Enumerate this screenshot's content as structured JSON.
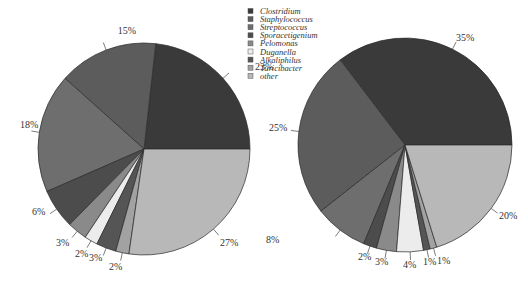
{
  "chart_data": [
    {
      "type": "pie",
      "title": "",
      "categories": [
        "Clostridium",
        "Staphylococcus",
        "Streptococcus",
        "Sporacetigenium",
        "Pelomonas",
        "Duganella",
        "Alkaliphilus",
        "Turicibacter",
        "other"
      ],
      "values": [
        23,
        15,
        18,
        6,
        3,
        2,
        3,
        2,
        27
      ],
      "labels": [
        "23%",
        "15%",
        "18%",
        "6%",
        "3%",
        "2%",
        "3%",
        "2%",
        "27%"
      ]
    },
    {
      "type": "pie",
      "title": "",
      "categories": [
        "Clostridium",
        "Staphylococcus",
        "Streptococcus",
        "Sporacetigenium",
        "Pelomonas",
        "Duganella",
        "Alkaliphilus",
        "Turicibacter",
        "other"
      ],
      "values": [
        35,
        25,
        8,
        2,
        3,
        4,
        1,
        1,
        20
      ],
      "labels": [
        "35%",
        "25%",
        "8%",
        "2%",
        "3%",
        "4%",
        "1%",
        "1%",
        "20%"
      ]
    }
  ],
  "legend": {
    "position": "top-center",
    "items": [
      {
        "label": "Clostridium",
        "color": "#3a3a3a"
      },
      {
        "label": "Staphylococcus",
        "color": "#5c5c5c"
      },
      {
        "label": "Streptococcus",
        "color": "#6e6e6e"
      },
      {
        "label": "Sporacetigenium",
        "color": "#4c4c4c"
      },
      {
        "label": "Pelomonas",
        "color": "#8a8a8a"
      },
      {
        "label": "Duganella",
        "color": "#ececec"
      },
      {
        "label": "Alkaliphilus",
        "color": "#555555"
      },
      {
        "label": "Turicibacter",
        "color": "#a2a2a2"
      },
      {
        "label": "other",
        "color": "#b8b8b8"
      }
    ]
  }
}
